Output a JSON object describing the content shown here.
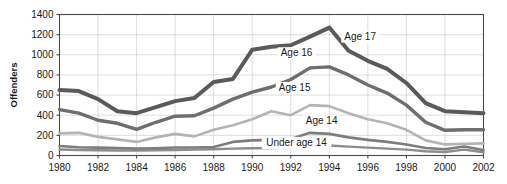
{
  "chart_data": {
    "type": "line",
    "title": "",
    "xlabel": "",
    "ylabel": "Offenders",
    "xlim": [
      1980,
      2002
    ],
    "ylim": [
      0,
      1400
    ],
    "ygrid": true,
    "xgrid": true,
    "legend_position": "inline-annotations",
    "y_ticks": [
      0,
      200,
      400,
      600,
      800,
      1000,
      1200,
      1400
    ],
    "y_tick_labels": [
      "0",
      "200",
      "400",
      "600",
      "800",
      "1000",
      "1200",
      "1400"
    ],
    "x_ticks": [
      1980,
      1982,
      1984,
      1986,
      1988,
      1990,
      1992,
      1994,
      1996,
      1998,
      2000,
      2002
    ],
    "x_tick_labels": [
      "1980",
      "1982",
      "1984",
      "1986",
      "1988",
      "1990",
      "1992",
      "1994",
      "1996",
      "1998",
      "2000",
      "2002"
    ],
    "x": [
      1980,
      1981,
      1982,
      1983,
      1984,
      1985,
      1986,
      1987,
      1988,
      1989,
      1990,
      1991,
      1992,
      1993,
      1994,
      1995,
      1996,
      1997,
      1998,
      1999,
      2000,
      2001,
      2002
    ],
    "series": [
      {
        "name": "Age 17",
        "label": "Age 17",
        "color": "#5a5a5a",
        "width": 4.0,
        "label_x": 1995.6,
        "label_y": 1150,
        "values": [
          650,
          640,
          560,
          440,
          420,
          480,
          540,
          570,
          730,
          760,
          1050,
          1080,
          1095,
          1180,
          1270,
          1040,
          940,
          860,
          720,
          520,
          440,
          430,
          420
        ]
      },
      {
        "name": "Age 16",
        "label": "Age 16",
        "color": "#6e6e6e",
        "width": 3.4,
        "label_x": 1992.3,
        "label_y": 985,
        "values": [
          455,
          420,
          350,
          320,
          260,
          330,
          390,
          395,
          470,
          560,
          630,
          680,
          755,
          870,
          880,
          800,
          700,
          620,
          500,
          330,
          250,
          255,
          255
        ]
      },
      {
        "name": "Age 15",
        "label": "Age 15",
        "color": "#b4b4b4",
        "width": 2.6,
        "label_x": 1992.2,
        "label_y": 640,
        "values": [
          220,
          225,
          185,
          160,
          135,
          180,
          215,
          190,
          255,
          300,
          360,
          440,
          400,
          500,
          490,
          420,
          360,
          320,
          255,
          150,
          110,
          115,
          120
        ]
      },
      {
        "name": "Age 14",
        "label": "Age 14",
        "color": "#7d7d7d",
        "width": 2.6,
        "label_x": 1993.6,
        "label_y": 310,
        "values": [
          95,
          82,
          78,
          75,
          68,
          72,
          80,
          80,
          85,
          135,
          150,
          155,
          165,
          225,
          215,
          180,
          155,
          135,
          110,
          75,
          62,
          90,
          55
        ]
      },
      {
        "name": "Under age 14",
        "label": "Under age 14",
        "color": "#8c8c8c",
        "width": 2.4,
        "label_x": 1992.3,
        "label_y": 95,
        "values": [
          60,
          55,
          52,
          50,
          48,
          52,
          55,
          58,
          62,
          68,
          72,
          75,
          78,
          95,
          100,
          88,
          78,
          68,
          58,
          42,
          35,
          58,
          32
        ]
      }
    ]
  },
  "axis": {
    "y_title": "Offenders"
  }
}
